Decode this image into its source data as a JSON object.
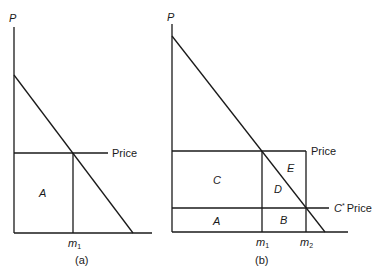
{
  "panels": [
    {
      "caption": "(a)",
      "y_axis_label": "P",
      "price_label": "Price",
      "m1_label": "m",
      "m1_sub": "1",
      "regions": {
        "A": "A"
      }
    },
    {
      "caption": "(b)",
      "y_axis_label": "P",
      "price_label": "Price",
      "cstar_price_label": "C* Price",
      "cstar_label": "C",
      "cstar_sup": "*",
      "cstar_price_word": "Price",
      "m1_label": "m",
      "m1_sub": "1",
      "m2_label": "m",
      "m2_sub": "2",
      "regions": {
        "A": "A",
        "B": "B",
        "C": "C",
        "D": "D",
        "E": "E"
      }
    }
  ]
}
